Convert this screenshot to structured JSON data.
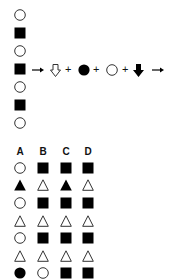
{
  "sequence": {
    "items": [
      "circle",
      "square",
      "circle",
      "square",
      "circle",
      "square",
      "circle"
    ]
  },
  "rule": {
    "tokens": [
      {
        "type": "arrow-right"
      },
      {
        "type": "hollow-down-arrow"
      },
      {
        "type": "plus",
        "text": "+"
      },
      {
        "type": "filled-circle"
      },
      {
        "type": "plus",
        "text": "+"
      },
      {
        "type": "hollow-circle"
      },
      {
        "type": "plus",
        "text": "+"
      },
      {
        "type": "filled-down-arrow"
      },
      {
        "type": "arrow-right"
      }
    ]
  },
  "options": {
    "headers": [
      "A",
      "B",
      "C",
      "D"
    ],
    "columns": {
      "A": [
        "hollow-circle",
        "filled-triangle",
        "hollow-circle",
        "hollow-triangle",
        "hollow-circle",
        "hollow-triangle",
        "filled-circle"
      ],
      "B": [
        "filled-square",
        "hollow-triangle",
        "filled-square",
        "hollow-triangle",
        "filled-square",
        "hollow-triangle",
        "hollow-circle"
      ],
      "C": [
        "filled-square",
        "filled-triangle",
        "filled-square",
        "hollow-triangle",
        "filled-square",
        "hollow-triangle",
        "filled-square"
      ],
      "D": [
        "filled-square",
        "hollow-triangle",
        "filled-square",
        "hollow-triangle",
        "filled-square",
        "hollow-triangle",
        "filled-square"
      ]
    }
  }
}
